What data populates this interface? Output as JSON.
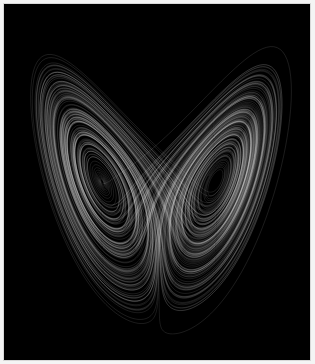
{
  "image": {
    "subject": "Lorenz attractor",
    "background_color": "#000000",
    "stroke_color": "#ffffff",
    "border_color": "#d8d8d8",
    "params": {
      "sigma": 10,
      "rho": 28,
      "beta": 2.6667
    },
    "projection": {
      "cx": 155,
      "cy": 178,
      "sx": 6.1,
      "sz": 6.2,
      "z0": 27
    }
  }
}
